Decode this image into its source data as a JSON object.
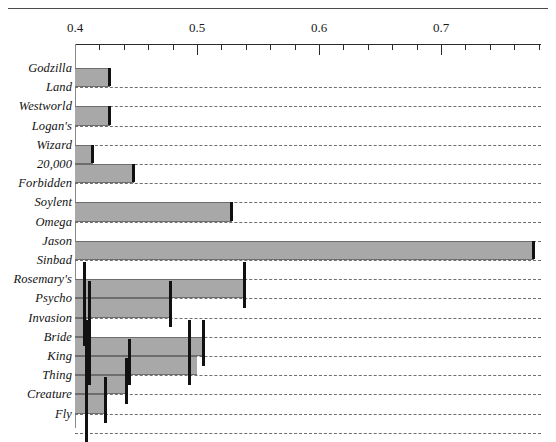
{
  "chart_data": {
    "type": "bar",
    "orientation": "horizontal",
    "title": "",
    "xlabel": "",
    "ylabel": "",
    "xlim": [
      0.4,
      0.782
    ],
    "grid": true,
    "legend": null,
    "axis": {
      "major_ticks": [
        0.4,
        0.5,
        0.6,
        0.7
      ],
      "major_tick_labels": [
        "0.4",
        "0.5",
        "0.6",
        "0.7"
      ],
      "minor_tick_step": 0.02,
      "minor_ticks": [
        0.42,
        0.44,
        0.46,
        0.48,
        0.52,
        0.54,
        0.56,
        0.58,
        0.62,
        0.64,
        0.66,
        0.68,
        0.72,
        0.74,
        0.76,
        0.78
      ]
    },
    "categories": [
      "Godzilla",
      "Land",
      "Westworld",
      "Logan's",
      "Wizard",
      "20,000",
      "Forbidden",
      "Soylent",
      "Omega",
      "Jason",
      "Sinbad",
      "Rosemary's",
      "Psycho",
      "Invasion",
      "Bride",
      "King",
      "Thing",
      "Creature",
      "Fly"
    ],
    "bars": [
      {
        "label": "Godzilla",
        "value": 0.429,
        "cap": 0.429
      },
      {
        "label": "Land",
        "value": 0.4,
        "cap": null
      },
      {
        "label": "Westworld",
        "value": 0.429,
        "cap": 0.429
      },
      {
        "label": "Logan's",
        "value": 0.4,
        "cap": null
      },
      {
        "label": "Wizard",
        "value": 0.415,
        "cap": 0.415
      },
      {
        "label": "20,000",
        "value": 0.448,
        "cap": 0.448
      },
      {
        "label": "Forbidden",
        "value": 0.4,
        "cap": null
      },
      {
        "label": "Soylent",
        "value": 0.529,
        "cap": 0.529
      },
      {
        "label": "Omega",
        "value": 0.4,
        "cap": null
      },
      {
        "label": "Jason",
        "value": 0.776,
        "cap": 0.776
      },
      {
        "label": "Sinbad",
        "value": 0.4,
        "cap": null
      },
      {
        "label": "Rosemary's",
        "value": 0.539,
        "cap": 0.408
      },
      {
        "label": "Psycho",
        "value": 0.479,
        "cap": 0.412
      },
      {
        "label": "Invasion",
        "value": 0.41,
        "cap": 0.408
      },
      {
        "label": "Bride",
        "value": 0.506,
        "cap": 0.41
      },
      {
        "label": "King",
        "value": 0.5,
        "cap": 0.412
      },
      {
        "label": "Thing",
        "value": 0.443,
        "cap": 0.41
      },
      {
        "label": "Creature",
        "value": 0.425,
        "cap": 0.41
      },
      {
        "label": "Fly",
        "value": 0.4,
        "cap": null
      }
    ],
    "caps_extra": [
      {
        "row": 11,
        "positions": [
          0.408,
          0.539
        ]
      },
      {
        "row": 12,
        "positions": [
          0.412,
          0.479
        ]
      },
      {
        "row": 13,
        "positions": [
          0.408,
          0.412
        ]
      },
      {
        "row": 14,
        "positions": [
          0.41,
          0.494,
          0.506
        ]
      },
      {
        "row": 15,
        "positions": [
          0.412,
          0.445,
          0.494
        ]
      },
      {
        "row": 16,
        "positions": [
          0.41,
          0.443
        ]
      },
      {
        "row": 17,
        "positions": [
          0.41,
          0.425
        ]
      },
      {
        "row": 18,
        "positions": [
          0.41
        ]
      }
    ],
    "series_note": "Gray horizontal bars with black vertical end-cap markers; dashed gridlines at each row boundary."
  },
  "colors": {
    "bar_fill": "#a8a8a8",
    "bar_stroke": "#6d6d6d",
    "cap": "#111111",
    "grid": "#6f6f6f",
    "axis": "#2b2b2b",
    "text": "#111111",
    "background": "#ffffff"
  }
}
